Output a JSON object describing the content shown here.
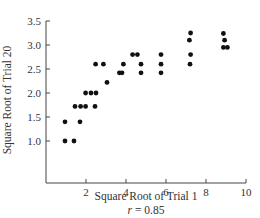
{
  "chart_data": {
    "type": "scatter",
    "title": "",
    "xlabel": "Square Root of Trial 1",
    "ylabel": "Square Root of Trial 20",
    "annotation": "r = 0.85",
    "annotation_parts": {
      "var": "r",
      "rest": " = 0.85"
    },
    "xlim": [
      0,
      10
    ],
    "ylim": [
      0.13,
      3.5
    ],
    "xticks": [
      2,
      4,
      6,
      8,
      10
    ],
    "xtick_labels": [
      "2",
      "4",
      "6",
      "8",
      "10"
    ],
    "yticks": [
      1.0,
      1.5,
      2.0,
      2.5,
      3.0,
      3.5
    ],
    "ytick_labels": [
      "1.0",
      "1.5",
      "2.0",
      "2.5",
      "3.0",
      "3.5"
    ],
    "grid": false,
    "legend": null,
    "marker_color": "#111111",
    "points": [
      {
        "x": 0.95,
        "y": 1.0
      },
      {
        "x": 1.4,
        "y": 1.0
      },
      {
        "x": 0.95,
        "y": 1.4
      },
      {
        "x": 1.7,
        "y": 1.4
      },
      {
        "x": 1.45,
        "y": 1.72
      },
      {
        "x": 1.73,
        "y": 1.72
      },
      {
        "x": 1.98,
        "y": 1.72
      },
      {
        "x": 2.45,
        "y": 1.72
      },
      {
        "x": 1.98,
        "y": 2.0
      },
      {
        "x": 2.25,
        "y": 2.0
      },
      {
        "x": 2.5,
        "y": 2.0
      },
      {
        "x": 3.05,
        "y": 2.22
      },
      {
        "x": 2.48,
        "y": 2.6
      },
      {
        "x": 2.87,
        "y": 2.6
      },
      {
        "x": 3.67,
        "y": 2.42
      },
      {
        "x": 3.8,
        "y": 2.42
      },
      {
        "x": 3.87,
        "y": 2.6
      },
      {
        "x": 4.33,
        "y": 2.8
      },
      {
        "x": 4.57,
        "y": 2.8
      },
      {
        "x": 4.75,
        "y": 2.6
      },
      {
        "x": 4.75,
        "y": 2.42
      },
      {
        "x": 5.75,
        "y": 2.8
      },
      {
        "x": 5.75,
        "y": 2.6
      },
      {
        "x": 5.75,
        "y": 2.42
      },
      {
        "x": 7.23,
        "y": 3.25
      },
      {
        "x": 7.17,
        "y": 3.1
      },
      {
        "x": 7.23,
        "y": 2.8
      },
      {
        "x": 7.2,
        "y": 2.6
      },
      {
        "x": 8.87,
        "y": 3.24
      },
      {
        "x": 8.93,
        "y": 3.1
      },
      {
        "x": 8.87,
        "y": 2.95
      },
      {
        "x": 9.07,
        "y": 2.95
      }
    ]
  }
}
